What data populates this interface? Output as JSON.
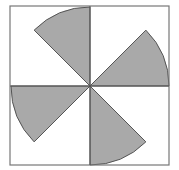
{
  "diagram": {
    "square": {
      "x": 10,
      "y": 6,
      "size": 159
    },
    "center": {
      "x": 90,
      "y": 86
    },
    "radius": 79,
    "colors": {
      "fill": "#a9a9a9",
      "stroke": "#555555",
      "border": "#777777",
      "background": "#ffffff"
    },
    "sectors": [
      {
        "name": "sector-top",
        "start_deg": 90,
        "end_deg": 135
      },
      {
        "name": "sector-right",
        "start_deg": 0,
        "end_deg": 45
      },
      {
        "name": "sector-left",
        "start_deg": 180,
        "end_deg": 225
      },
      {
        "name": "sector-bottom",
        "start_deg": 270,
        "end_deg": 315
      }
    ]
  }
}
